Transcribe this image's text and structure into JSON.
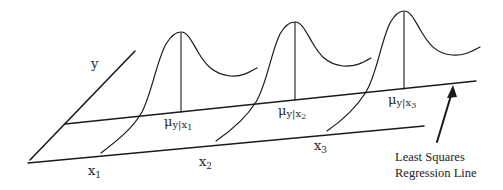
{
  "diagram": {
    "type": "regression-conditional-distributions",
    "axis_labels": {
      "y": "y",
      "x1": "x",
      "x1_sub": "1",
      "x2": "x",
      "x2_sub": "2",
      "x3": "x",
      "x3_sub": "3"
    },
    "means": [
      {
        "mu": "μ",
        "sub_y": "y",
        "bar": "|",
        "sub_x": "x",
        "sub_idx": "1"
      },
      {
        "mu": "μ",
        "sub_y": "y",
        "bar": "|",
        "sub_x": "x",
        "sub_idx": "2"
      },
      {
        "mu": "μ",
        "sub_y": "y",
        "bar": "|",
        "sub_x": "x",
        "sub_idx": "3"
      }
    ],
    "annotation": {
      "line1": "Least Squares",
      "line2": "Regression Line"
    },
    "colors": {
      "stroke": "#1a1a1a",
      "background": "#ffffff"
    }
  }
}
